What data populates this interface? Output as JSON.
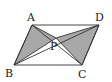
{
  "diagram": {
    "type": "geometry",
    "shape": "parallelogram",
    "points": {
      "A": {
        "label": "A",
        "x": 32,
        "y": 25
      },
      "B": {
        "label": "B",
        "x": 14,
        "y": 65
      },
      "C": {
        "label": "C",
        "x": 82,
        "y": 65
      },
      "D": {
        "label": "D",
        "x": 99,
        "y": 25
      },
      "P": {
        "label": "P",
        "x": 56,
        "y": 38
      }
    },
    "shaded_triangles": [
      "ABP",
      "PCD"
    ],
    "colors": {
      "stroke": "#333333",
      "shade": "#a8a8a8",
      "background": "#ffffff"
    }
  }
}
